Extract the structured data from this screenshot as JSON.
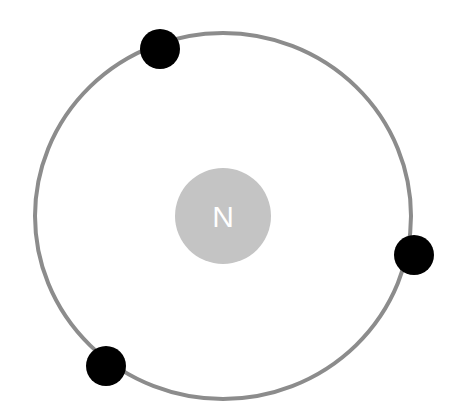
{
  "diagram": {
    "type": "atom-bohr-model",
    "nucleus": {
      "label": "N",
      "color": "#c4c4c4",
      "label_color": "#ffffff",
      "cx": 223,
      "cy": 216,
      "r": 48
    },
    "orbit": {
      "cx": 223,
      "cy": 216,
      "rx": 188,
      "ry": 183,
      "stroke": "#8c8c8c",
      "stroke_width": 4
    },
    "electrons": [
      {
        "cx": 160,
        "cy": 49,
        "r": 20,
        "color": "#000000"
      },
      {
        "cx": 414,
        "cy": 255,
        "r": 20,
        "color": "#000000"
      },
      {
        "cx": 106,
        "cy": 366,
        "r": 20,
        "color": "#000000"
      }
    ],
    "electron_count": 3
  }
}
